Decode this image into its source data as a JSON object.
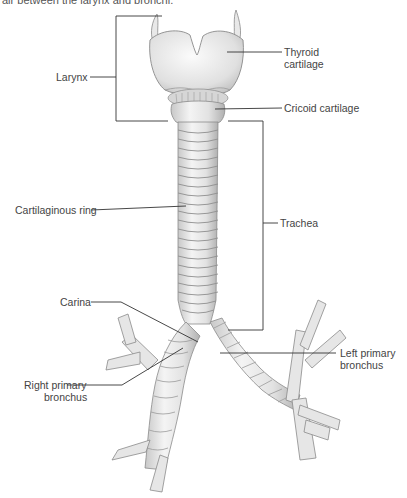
{
  "caption": "air between the larynx and bronchi.",
  "figure": {
    "labels": {
      "larynx": "Larynx",
      "thyroid_line1": "Thyroid",
      "thyroid_line2": "cartilage",
      "cricoid": "Cricoid cartilage",
      "cartilaginous_ring": "Cartilaginous ring",
      "trachea": "Trachea",
      "carina": "Carina",
      "left_bronchus_line1": "Left primary",
      "left_bronchus_line2": "bronchus",
      "right_bronchus_line1": "Right primary",
      "right_bronchus_line2": "bronchus"
    },
    "colors": {
      "line": "#333333",
      "tissue_fill": "#eeeeee",
      "tissue_shade": "#bdbdbd",
      "tissue_stroke": "#8a8a8a"
    }
  }
}
